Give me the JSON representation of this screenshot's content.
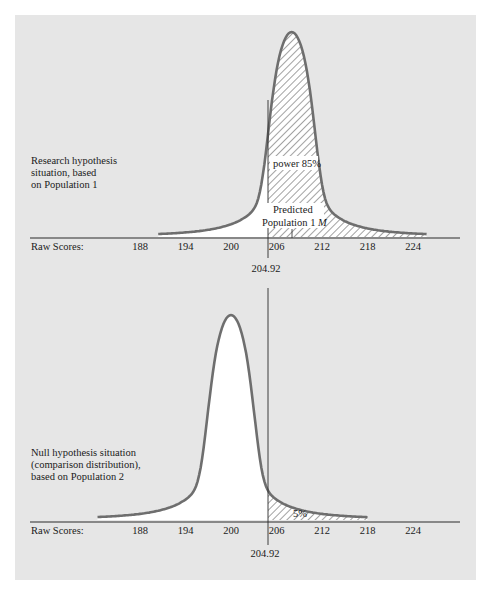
{
  "chart_data": [
    {
      "type": "area",
      "title": "Research hypothesis situation, based on Population 1",
      "description": "Research hypothesis situation, based on Population 1",
      "xlabel": "Raw Scores:",
      "x_ticks": [
        188,
        194,
        200,
        206,
        212,
        218,
        224
      ],
      "distribution_mean": 208,
      "x_range": [
        190.4,
        225.9
      ],
      "cutoff": 204.92,
      "cutoff_label": "204.92",
      "shaded_region": "right of cutoff",
      "annotations": [
        "power 85%",
        "Predicted Population 1 M"
      ],
      "power_percent": 85
    },
    {
      "type": "area",
      "title": "Null hypothesis situation (comparison distribution), based on Population 2",
      "description": "Null hypothesis situation (comparison distribution), based on Population 2",
      "xlabel": "Raw Scores:",
      "x_ticks": [
        188,
        194,
        200,
        206,
        212,
        218,
        224
      ],
      "distribution_mean": 200,
      "x_range": [
        182.4,
        218
      ],
      "cutoff": 204.92,
      "cutoff_label": "204.92",
      "shaded_region": "right of cutoff",
      "annotations": [
        "5%"
      ],
      "alpha_percent": 5
    }
  ],
  "colors": {
    "panel": "#e6e6e6",
    "curve": "#6e6e6e",
    "hatch": "#8a8a8a",
    "axis": "#2a2a2a"
  },
  "top": {
    "description": "Research hypothesis\nsituation, based\non Population 1",
    "axis_label": "Raw Scores:",
    "ticks": [
      "188",
      "194",
      "200",
      "206",
      "212",
      "218",
      "224"
    ],
    "cutoff_label": "204.92",
    "power_label": "power 85%",
    "predicted_label_1": "Predicted",
    "predicted_label_2": "Population 1 ",
    "predicted_label_m": "M"
  },
  "bottom": {
    "description": "Null hypothesis situation\n(comparison distribution),\nbased on Population 2",
    "axis_label": "Raw Scores:",
    "ticks": [
      "188",
      "194",
      "200",
      "206",
      "212",
      "218",
      "224"
    ],
    "cutoff_label": "204.92",
    "alpha_label": "5%"
  }
}
